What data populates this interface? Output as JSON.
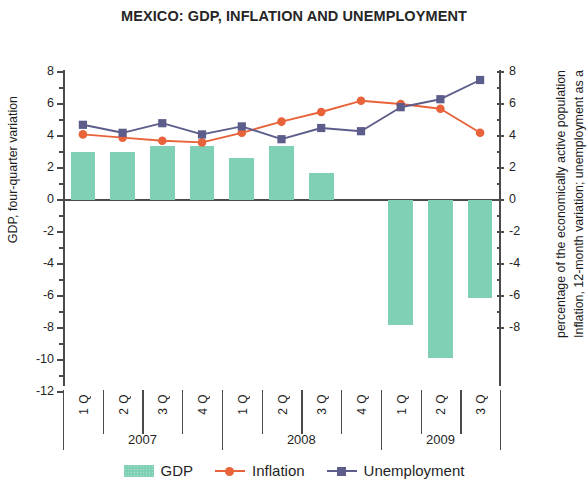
{
  "chart_data": {
    "type": "bar",
    "title": "MEXICO: GDP, INFLATION AND UNEMPLOYMENT",
    "xlabel": "",
    "categories": [
      "1 Q",
      "2 Q",
      "3 Q",
      "4 Q",
      "1 Q",
      "2 Q",
      "3 Q",
      "4 Q",
      "1 Q",
      "2 Q",
      "3 Q"
    ],
    "group_labels": [
      "2007",
      "2008",
      "2009"
    ],
    "group_sizes": [
      4,
      4,
      3
    ],
    "left_axis": {
      "label": "GDP, four-quarter variation",
      "ticks": [
        8,
        6,
        4,
        2,
        0,
        -2,
        -4,
        -6,
        -8,
        -10,
        -12
      ],
      "ylim": [
        -12,
        8
      ]
    },
    "right_axis": {
      "label_line1": "Inflation, 12-month variation; unemployment as a",
      "label_line2": "percentage of the economically active population",
      "ticks": [
        8,
        6,
        4,
        2,
        0,
        -2,
        -4,
        -6,
        -8
      ],
      "ylim": [
        -8,
        8
      ]
    },
    "grid": false,
    "legend_position": "bottom",
    "series": [
      {
        "name": "GDP",
        "type": "bar",
        "axis": "left",
        "color": "#7fd0b5",
        "values": [
          3.0,
          3.0,
          3.4,
          3.4,
          2.6,
          3.4,
          1.7,
          0.0,
          -7.8,
          -9.9,
          -6.1
        ]
      },
      {
        "name": "Inflation",
        "type": "line",
        "axis": "right",
        "color": "#e8633a",
        "marker": "circle",
        "values": [
          4.1,
          3.9,
          3.7,
          3.6,
          4.2,
          4.9,
          5.5,
          6.2,
          6.0,
          5.7,
          4.2
        ]
      },
      {
        "name": "Unemployment",
        "type": "line",
        "axis": "right",
        "color": "#5d5d8c",
        "marker": "square",
        "values": [
          4.7,
          4.2,
          4.8,
          4.1,
          4.6,
          3.8,
          4.5,
          4.3,
          5.8,
          6.3,
          7.5
        ]
      }
    ]
  },
  "legend": {
    "gdp": "GDP",
    "inflation": "Inflation",
    "unemployment": "Unemployment"
  }
}
